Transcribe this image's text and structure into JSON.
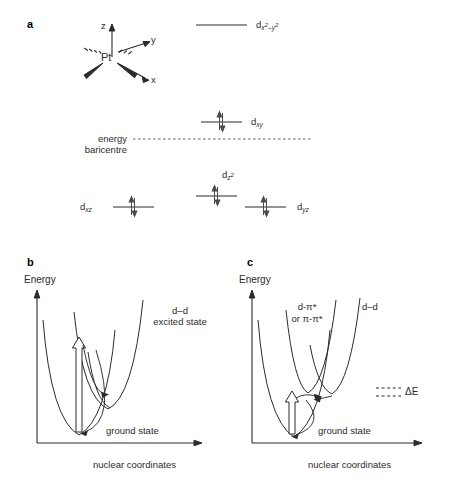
{
  "figure": {
    "panels": {
      "a": {
        "letter": "a"
      },
      "b": {
        "letter": "b"
      },
      "c": {
        "letter": "c"
      }
    }
  },
  "panel_a": {
    "center_atom": "Pt",
    "axes": [
      {
        "name": "z-axis-label",
        "label": "z"
      },
      {
        "name": "y-axis-label",
        "label": "y"
      },
      {
        "name": "x-axis-label",
        "label": "x"
      }
    ],
    "baricentre_label_line1": "energy",
    "baricentre_label_line2": "baricentre",
    "orbitals": [
      {
        "id": "dx2y2",
        "base": "d",
        "sub": "x",
        "sup1": "2",
        "mid": "–y",
        "sup2": "2",
        "occupancy": 0,
        "level": "top"
      },
      {
        "id": "dxy",
        "base": "d",
        "sub": "xy",
        "occupancy": 2,
        "level": "above-baricentre"
      },
      {
        "id": "dz2",
        "base": "d",
        "sub": "z",
        "sup1": "2",
        "occupancy": 2,
        "level": "lower-middle"
      },
      {
        "id": "dxz",
        "base": "d",
        "sub": "xz",
        "occupancy": 2,
        "level": "lower"
      },
      {
        "id": "dyz",
        "base": "d",
        "sub": "yz",
        "occupancy": 2,
        "level": "lower"
      }
    ]
  },
  "panel_b": {
    "y_axis_label": "Energy",
    "x_axis_label": "nuclear coordinates",
    "curves": [
      {
        "id": "ground",
        "label": "ground state"
      },
      {
        "id": "dd-excited",
        "label_line1": "d–d",
        "label_line2": "excited state"
      }
    ]
  },
  "panel_c": {
    "y_axis_label": "Energy",
    "x_axis_label": "nuclear coordinates",
    "curves": [
      {
        "id": "ground",
        "label": "ground state"
      },
      {
        "id": "ct-excited",
        "label_line1": "d-π*",
        "label_line2": "or π-π*"
      },
      {
        "id": "dd-excited",
        "label": "d–d"
      }
    ],
    "annotation": {
      "id": "delta-e",
      "label": "ΔE"
    }
  },
  "colors": {
    "stroke": "#2b2b2b",
    "text": "#1a1a1a",
    "background": "#ffffff",
    "electron": "#555555"
  }
}
